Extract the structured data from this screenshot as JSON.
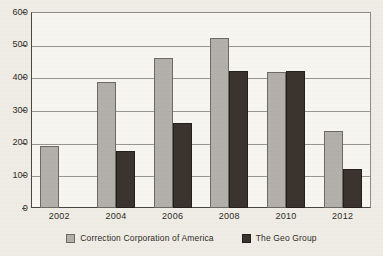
{
  "chart_data": {
    "type": "bar",
    "title": "",
    "xlabel": "",
    "ylabel": "",
    "categories": [
      "2002",
      "2004",
      "2006",
      "2008",
      "2010",
      "2012"
    ],
    "series": [
      {
        "name": "Correction Corporation of America",
        "color": "#b3b0aa",
        "values": [
          190,
          385,
          460,
          520,
          415,
          235
        ]
      },
      {
        "name": "The Geo Group",
        "color": "#3a332e",
        "values": [
          null,
          175,
          260,
          420,
          420,
          120
        ]
      }
    ],
    "ylim": [
      0,
      600
    ],
    "yticks": [
      "0",
      "100",
      "200",
      "300",
      "400",
      "500",
      "600"
    ],
    "grid": true,
    "legend_position": "bottom"
  },
  "legend": {
    "items": [
      {
        "label": "Correction Corporation of America",
        "swatch": "legend-swatch-gray"
      },
      {
        "label": "The Geo Group",
        "swatch": "legend-swatch-dark"
      }
    ]
  }
}
